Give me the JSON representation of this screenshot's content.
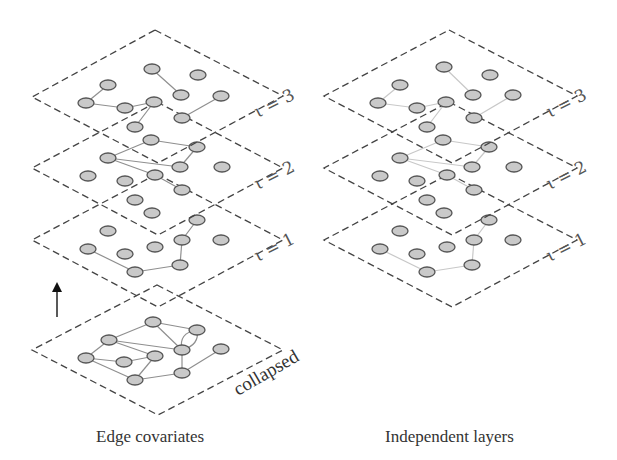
{
  "figure": {
    "panels": [
      {
        "id": "left",
        "caption": "Edge covariates",
        "offset_x": 0,
        "edge_color": "#8f8f8f",
        "layers": [
          {
            "label": "ι = 3",
            "dy": 0
          },
          {
            "label": "ι = 2",
            "dy": 72
          },
          {
            "label": "ι = 1",
            "dy": 144
          }
        ],
        "collapsed_label": "collapsed",
        "has_arrow": true
      },
      {
        "id": "right",
        "caption": "Independent layers",
        "offset_x": 294,
        "edge_color": "#c8c8c8",
        "layers": [
          {
            "label": "ι = 3",
            "dy": 0
          },
          {
            "label": "ι = 2",
            "dy": 72
          },
          {
            "label": "ι = 1",
            "dy": 144
          }
        ],
        "has_arrow": false
      }
    ],
    "node_fill": "#c9c9c9",
    "node_stroke": "#555555",
    "plane_stroke": "#444444"
  },
  "labels": {
    "left_l3": "ι = 3",
    "left_l2": "ι = 2",
    "left_l1": "ι = 1",
    "left_collapsed": "collapsed",
    "right_l3": "ι = 3",
    "right_l2": "ι = 2",
    "right_l1": "ι = 1",
    "left_caption": "Edge covariates",
    "right_caption": "Independent layers"
  }
}
